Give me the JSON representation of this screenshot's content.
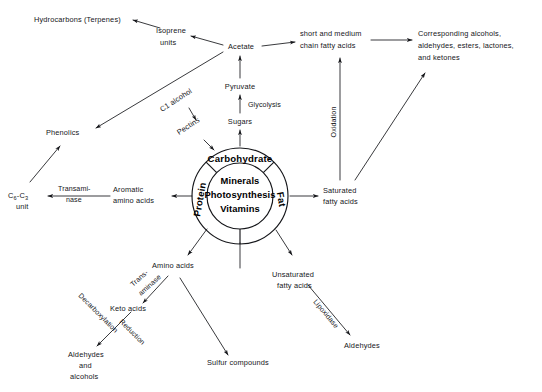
{
  "diagram": {
    "ink_color": "#15161a",
    "background_color": "#ffffff"
  },
  "center": {
    "core": {
      "line1": "Minerals",
      "line2": "Photosynthesis",
      "line3": "Vitamins"
    },
    "ring_sectors": [
      {
        "id": "carbohydrate",
        "label": "Carbohydrate",
        "position": "top"
      },
      {
        "id": "fat",
        "label": "Fat",
        "position": "right"
      },
      {
        "id": "protein",
        "label": "Protein",
        "position": "left"
      }
    ]
  },
  "nodes": {
    "hydrocarbons": "Hydrocarbons (Terpenes)",
    "isoprene_line1": "Isoprene",
    "isoprene_line2": "units",
    "acetate": "Acetate",
    "short_medium_line1": "short and medium",
    "short_medium_line2": "chain fatty acids",
    "corresponding_line1": "Corresponding alcohols,",
    "corresponding_line2": "aldehydes, esters, lactones,",
    "corresponding_line3": "and ketones",
    "pyruvate": "Pyruvate",
    "sugars": "Sugars",
    "phenolics": "Phenolics",
    "c1_alcohol": "C1 alcohol",
    "pectins": "Pectins",
    "c6c3_main": "C",
    "c6c3_sub1": "6",
    "c6c3_mid": "-C",
    "c6c3_sub2": "3",
    "c6c3_unit": "unit",
    "aromatic_line1": "Aromatic",
    "aromatic_line2": "amino acids",
    "saturated_line1": "Saturated",
    "saturated_line2": "fatty acids",
    "unsaturated_line1": "Unsaturated",
    "unsaturated_line2": "fatty acids",
    "aldehydes_right": "Aldehydes",
    "amino_acids": "Amino acids",
    "keto_acids": "Keto acids",
    "aldehydes_alcohols_line1": "Aldehydes",
    "aldehydes_alcohols_line2": "and",
    "aldehydes_alcohols_line3": "alcohols",
    "sulfur_compounds": "Sulfur compounds"
  },
  "edge_labels": {
    "glycolysis": "Glycolysis",
    "oxidation": "Oxidation",
    "transaminase_line1": "Transami-",
    "transaminase_line2": "nase",
    "lipoxidase": "Lipoxidase",
    "decarboxylation": "Decarboxylation",
    "reduction": "Reduction",
    "transaminase2_line1": "Trans-",
    "transaminase2_line2": "aminase"
  }
}
